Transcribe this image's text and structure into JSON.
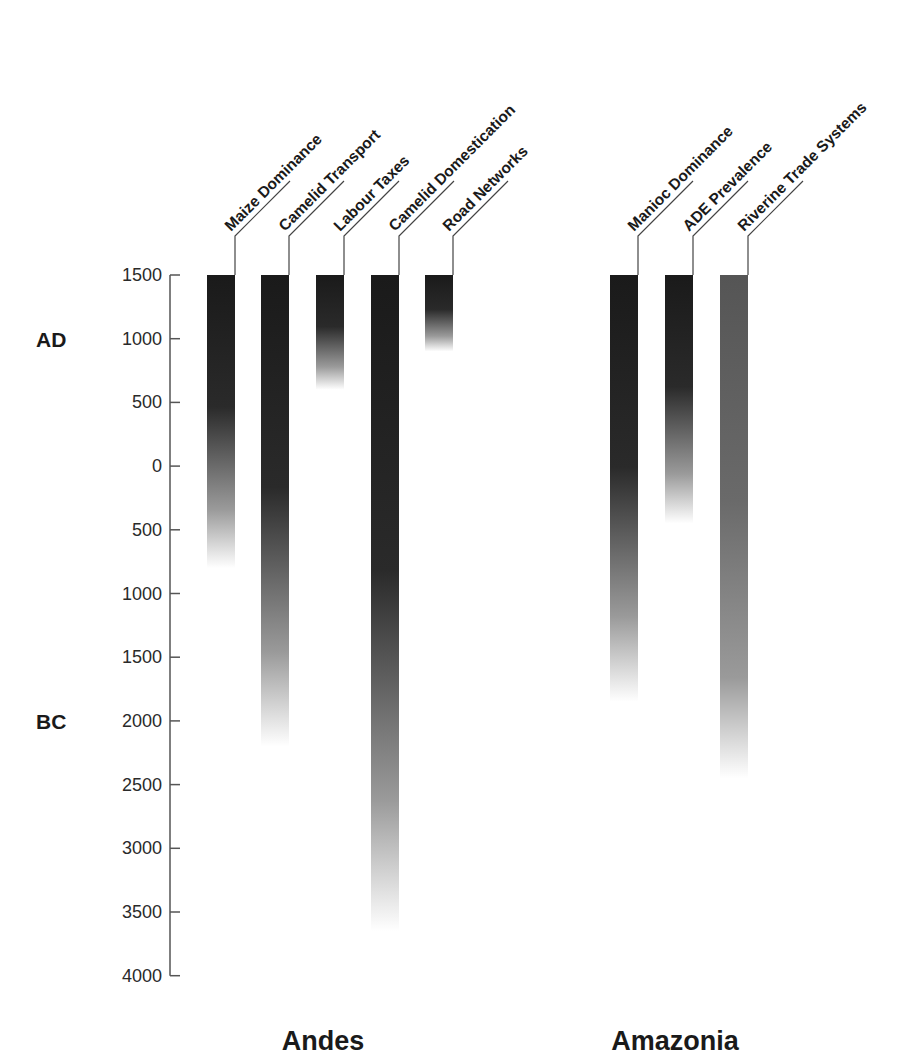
{
  "chart_data": {
    "type": "bar",
    "subtype": "timeline-gradient-bars",
    "title": "",
    "ylabel": "",
    "y_axis": {
      "direction": "top = recent",
      "ticks": [
        {
          "label": "1500",
          "year": 1500
        },
        {
          "label": "1000",
          "year": 1000
        },
        {
          "label": "500",
          "year": 500
        },
        {
          "label": "0",
          "year": 0
        },
        {
          "label": "500",
          "year": -500
        },
        {
          "label": "1000",
          "year": -1000
        },
        {
          "label": "1500",
          "year": -1500
        },
        {
          "label": "2000",
          "year": -2000
        },
        {
          "label": "2500",
          "year": -2500
        },
        {
          "label": "3000",
          "year": -3000
        },
        {
          "label": "3500",
          "year": -3500
        },
        {
          "label": "4000",
          "year": -4000
        }
      ],
      "range": [
        -4000,
        1500
      ],
      "era_labels": [
        {
          "label": "AD",
          "year": 1000
        },
        {
          "label": "BC",
          "year": -2000
        }
      ]
    },
    "grid": false,
    "groups": [
      {
        "name": "Andes",
        "series": [
          {
            "name": "Maize Dominance",
            "start": 1500,
            "end": -800,
            "color_top": "#1a1a1a"
          },
          {
            "name": "Camelid Transport",
            "start": 1500,
            "end": -2200,
            "color_top": "#1a1a1a"
          },
          {
            "name": "Labour Taxes",
            "start": 1500,
            "end": 600,
            "color_top": "#1a1a1a"
          },
          {
            "name": "Camelid Domestication",
            "start": 1500,
            "end": -3650,
            "color_top": "#1a1a1a"
          },
          {
            "name": "Road Networks",
            "start": 1500,
            "end": 900,
            "color_top": "#1a1a1a"
          }
        ]
      },
      {
        "name": "Amazonia",
        "series": [
          {
            "name": "Manioc Dominance",
            "start": 1500,
            "end": -1850,
            "color_top": "#1a1a1a"
          },
          {
            "name": "ADE Prevalence",
            "start": 1500,
            "end": -450,
            "color_top": "#1a1a1a"
          },
          {
            "name": "Riverine Trade Systems",
            "start": 1500,
            "end": -2450,
            "color_top": "#555555"
          }
        ]
      }
    ]
  },
  "layout": {
    "axis_x": 170,
    "y_top_px": 275,
    "px_per_500": 63.7,
    "bar_width": 28,
    "bar_x": [
      207,
      261,
      316,
      371,
      425,
      610,
      665,
      720
    ],
    "region_label_x": [
      323,
      675
    ],
    "region_label_y": 1050
  }
}
